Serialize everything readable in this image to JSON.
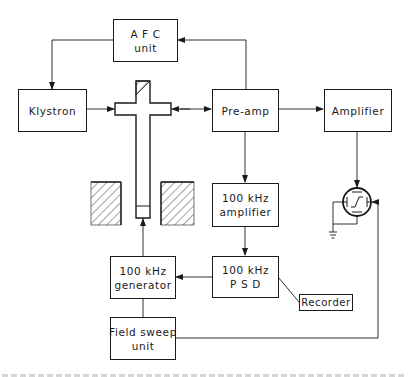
{
  "diagram": {
    "blocks": {
      "afc": {
        "line1": "A F C",
        "line2": "unit"
      },
      "klystron": {
        "label": "Klystron"
      },
      "preamp": {
        "label": "Pre-amp"
      },
      "amplifier": {
        "label": "Amplifier"
      },
      "khz_amplifier": {
        "line1": "100  kHz",
        "line2": "amplifier"
      },
      "psd": {
        "line1": "100  kHz",
        "line2": "P S D"
      },
      "recorder": {
        "label": "Recorder"
      },
      "generator": {
        "line1": "100  kHz",
        "line2": "generator"
      },
      "field_sweep": {
        "line1": "Field  sweep",
        "line2": "unit"
      }
    },
    "components": [
      {
        "name": "waveguide-cross",
        "kind": "microwave bridge / cavity"
      },
      {
        "name": "magnet-pole-left",
        "kind": "hatched magnet pole"
      },
      {
        "name": "magnet-pole-right",
        "kind": "hatched magnet pole"
      },
      {
        "name": "oscilloscope",
        "kind": "CRT display"
      },
      {
        "name": "ground",
        "kind": "earth symbol"
      }
    ],
    "connections": [
      {
        "from": "AFC unit",
        "to": "Klystron"
      },
      {
        "from": "Pre-amp",
        "to": "AFC unit"
      },
      {
        "from": "Klystron",
        "to": "waveguide-cross"
      },
      {
        "from": "waveguide-cross",
        "to": "Pre-amp",
        "bidirectional": true
      },
      {
        "from": "Pre-amp",
        "to": "Amplifier"
      },
      {
        "from": "Pre-amp",
        "to": "100 kHz amplifier"
      },
      {
        "from": "Amplifier",
        "to": "oscilloscope"
      },
      {
        "from": "100 kHz amplifier",
        "to": "100 kHz PSD"
      },
      {
        "from": "100 kHz PSD",
        "to": "100 kHz generator"
      },
      {
        "from": "100 kHz PSD",
        "to": "Recorder"
      },
      {
        "from": "100 kHz generator",
        "to": "waveguide-cross"
      },
      {
        "from": "100 kHz generator",
        "to": "Field sweep unit"
      },
      {
        "from": "Field sweep unit",
        "to": "oscilloscope"
      }
    ],
    "colors": {
      "ink": "#1a1a1a",
      "background": "#ffffff"
    }
  }
}
